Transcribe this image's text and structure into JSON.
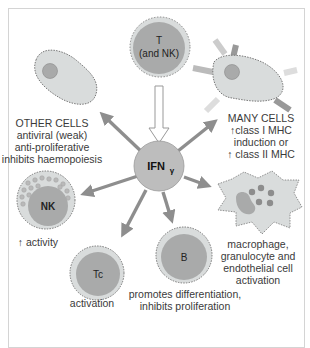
{
  "diagram": {
    "center": {
      "label": "IFN",
      "subscript": "γ"
    },
    "source_cell": {
      "line1": "T",
      "line2": "(and NK)"
    },
    "targets": {
      "other_cells": {
        "title": "OTHER CELLS",
        "lines": [
          "antiviral (weak)",
          "anti-proliferative",
          "inhibits haemopoiesis"
        ]
      },
      "many_cells": {
        "title": "MANY CELLS",
        "lines": [
          "↑class I MHC",
          "induction or",
          "↑ class II MHC"
        ]
      },
      "nk": {
        "cell_label": "NK",
        "lines": [
          "↑ activity"
        ]
      },
      "tc": {
        "cell_label": "Tc",
        "lines": [
          "activation"
        ]
      },
      "b": {
        "cell_label": "B",
        "lines": [
          "promotes differentiation,",
          "inhibits proliferation"
        ]
      },
      "macrophage": {
        "lines": [
          "macrophage,",
          "granulocyte and",
          "endothelial cell",
          "activation"
        ]
      }
    },
    "colors": {
      "cell_fill": "#d9dcdc",
      "nucleus_fill": "#a9aaaa",
      "arrow": "#8e8e8e",
      "center_fill": "#bdbdbd",
      "frame": "#d4d4d4"
    }
  }
}
